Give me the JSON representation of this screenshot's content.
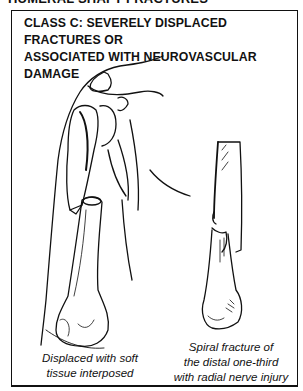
{
  "page_header": "HUMERAL SHAFT FRACTURES",
  "figure": {
    "title_lines": [
      "CLASS C: SEVERELY DISPLACED FRACTURES OR",
      "ASSOCIATED WITH NEUROVASCULAR DAMAGE"
    ],
    "illustrations": [
      {
        "name": "displaced-humerus",
        "caption_lines": [
          "Displaced with soft",
          "tissue interposed"
        ]
      },
      {
        "name": "spiral-fracture-humerus",
        "caption_lines": [
          "Spiral fracture of",
          "the distal one-third",
          "with radial nerve injury"
        ]
      }
    ]
  }
}
